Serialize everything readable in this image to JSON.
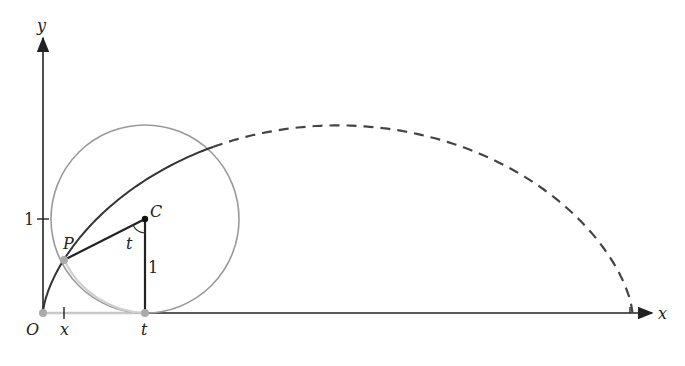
{
  "diagram": {
    "labels": {
      "y_axis": "y",
      "x_axis": "x",
      "origin": "O",
      "point_p": "P",
      "center_c": "C",
      "angle": "t",
      "radius_label": "1",
      "y_tick": "1",
      "x_coord": "x",
      "t_coord": "t"
    },
    "colors": {
      "axis": "#222222",
      "curve": "#333333",
      "circle": "#999999",
      "circle_light": "#c8c8c8",
      "point": "#aaaaaa"
    }
  }
}
